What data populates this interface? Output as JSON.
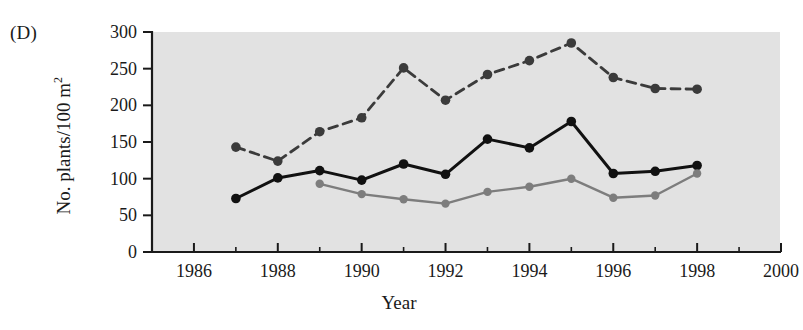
{
  "panel": {
    "label": "(D)"
  },
  "chart_data": {
    "type": "line",
    "title": "",
    "subtitle": "",
    "xlabel": "Year",
    "ylabel": "No. plants/100 m",
    "ylabel_exponent": "2",
    "xlim": [
      1985,
      2000
    ],
    "ylim": [
      0,
      300
    ],
    "grid": false,
    "legend_position": "none",
    "background_color": "#e2e2e2",
    "axis_color": "#1a1a1a",
    "x_ticks_major": [
      1986,
      1988,
      1990,
      1992,
      1994,
      1996,
      1998,
      2000
    ],
    "x_ticks_minor": [
      1987,
      1989,
      1991,
      1993,
      1995,
      1997,
      1999
    ],
    "x_tick_labels": [
      "1986",
      "1988",
      "1990",
      "1992",
      "1994",
      "1996",
      "1998",
      "2000"
    ],
    "y_ticks": [
      0,
      50,
      100,
      150,
      200,
      250,
      300
    ],
    "y_tick_labels": [
      "0",
      "50",
      "100",
      "150",
      "200",
      "250",
      "300"
    ],
    "series": [
      {
        "name": "dashed-dark-series",
        "style": "dashed",
        "color": "#3b3b3b",
        "marker": "circle",
        "x": [
          1987,
          1988,
          1989,
          1990,
          1991,
          1992,
          1993,
          1994,
          1995,
          1996,
          1997,
          1998
        ],
        "values": [
          143,
          124,
          164,
          183,
          251,
          207,
          242,
          261,
          285,
          238,
          223,
          222
        ]
      },
      {
        "name": "solid-black-series",
        "style": "solid",
        "color": "#111111",
        "marker": "circle",
        "x": [
          1987,
          1988,
          1989,
          1990,
          1991,
          1992,
          1993,
          1994,
          1995,
          1996,
          1997,
          1998
        ],
        "values": [
          73,
          101,
          111,
          98,
          120,
          106,
          154,
          142,
          178,
          107,
          110,
          118
        ]
      },
      {
        "name": "solid-gray-series",
        "style": "solid",
        "color": "#7d7d7d",
        "marker": "circle",
        "x": [
          1989,
          1990,
          1991,
          1992,
          1993,
          1994,
          1995,
          1996,
          1997,
          1998
        ],
        "values": [
          93,
          79,
          72,
          66,
          82,
          89,
          100,
          74,
          77,
          107
        ]
      }
    ]
  }
}
